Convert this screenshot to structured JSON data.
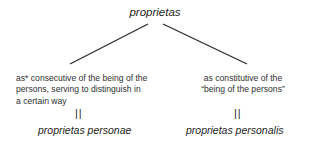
{
  "diagram": {
    "root": {
      "label": "proprietas"
    },
    "branches": [
      {
        "description_lines": [
          "as* consecutive of the being of the",
          "persons, serving to distinguish in",
          "a certain way"
        ],
        "equivalence_symbol": "||",
        "term": "proprietas personae"
      },
      {
        "description_lines": [
          "as constitutive of the",
          "“being of the persons”"
        ],
        "equivalence_symbol": "||",
        "term": "proprietas personalis"
      }
    ],
    "edges": [
      {
        "from": "proprietas",
        "to": "proprietas personae"
      },
      {
        "from": "proprietas",
        "to": "proprietas personalis"
      }
    ]
  }
}
